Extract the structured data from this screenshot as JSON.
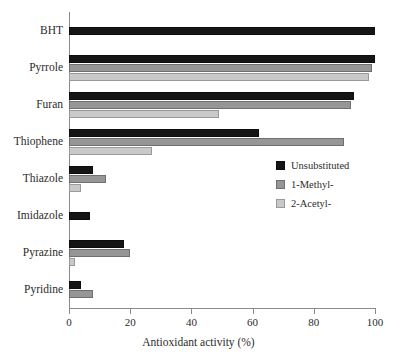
{
  "chart_data": {
    "type": "bar",
    "orientation": "horizontal",
    "title": "",
    "xlabel": "Antioxidant activity (%)",
    "ylabel": "",
    "xlim": [
      0,
      100
    ],
    "xticks": [
      0,
      20,
      40,
      60,
      80,
      100
    ],
    "xticklabels": [
      "0",
      "20",
      "40",
      "60",
      "80",
      "100"
    ],
    "grid": false,
    "legend_position": "center-right",
    "categories": [
      "BHT",
      "Pyrrole",
      "Furan",
      "Thiophene",
      "Thiazole",
      "Imidazole",
      "Pyrazine",
      "Pyridine"
    ],
    "series": [
      {
        "name": "Unsubstituted",
        "color": "#151515",
        "values": [
          100,
          100,
          93,
          62,
          8,
          7,
          18,
          4
        ]
      },
      {
        "name": "1-Methyl-",
        "color": "#969696",
        "values": [
          0,
          99,
          92,
          90,
          12,
          0,
          20,
          8
        ]
      },
      {
        "name": "2-Acetyl-",
        "color": "#c9c9c9",
        "values": [
          0,
          98,
          49,
          27,
          4,
          0,
          2,
          0
        ]
      }
    ]
  }
}
